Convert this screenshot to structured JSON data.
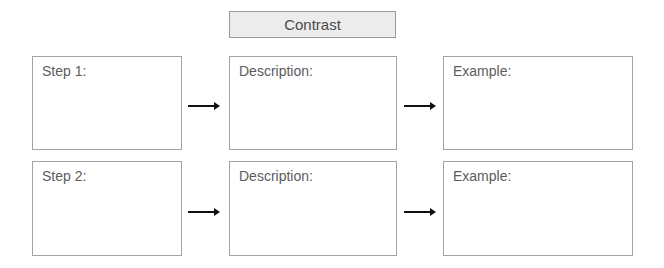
{
  "header": {
    "title": "Contrast"
  },
  "rows": [
    {
      "step": {
        "label": "Step 1:"
      },
      "description": {
        "label": "Description:"
      },
      "example": {
        "label": "Example:"
      }
    },
    {
      "step": {
        "label": "Step 2:"
      },
      "description": {
        "label": "Description:"
      },
      "example": {
        "label": "Example:"
      }
    }
  ],
  "colors": {
    "border": "#a3a3a3",
    "header_bg": "#ececec",
    "arrow": "#111111",
    "text": "#5c5c5c"
  }
}
